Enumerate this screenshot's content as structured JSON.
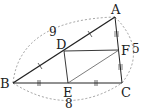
{
  "diagram": {
    "type": "geometry-triangle",
    "points": {
      "A": {
        "label": "A",
        "x": 115,
        "y": 17
      },
      "B": {
        "label": "B",
        "x": 13,
        "y": 83
      },
      "C": {
        "label": "C",
        "x": 122,
        "y": 83
      },
      "D": {
        "label": "D",
        "x": 64,
        "y": 51
      },
      "E": {
        "label": "E",
        "x": 68,
        "y": 83
      },
      "F": {
        "label": "F",
        "x": 119,
        "y": 50
      }
    },
    "segments": [
      "AB",
      "BC",
      "CA",
      "DF",
      "DE",
      "EF"
    ],
    "measurements": {
      "AB": "9",
      "AC": "5",
      "BC": "8"
    },
    "tick_marks": {
      "AB": "single",
      "BC": "double",
      "AC": "triple"
    },
    "colors": {
      "line": "#222222",
      "dashed": "#888888"
    }
  }
}
